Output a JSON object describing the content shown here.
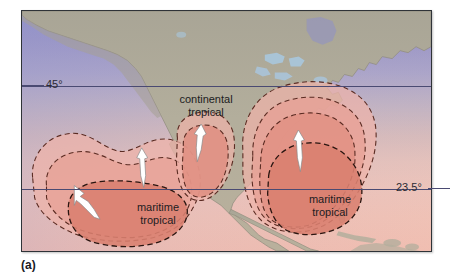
{
  "figure": {
    "caption": "(a)",
    "frame_color": "#2f3338"
  },
  "map": {
    "latitude_lines": [
      {
        "label": "45°",
        "value": 45,
        "y_px": 85,
        "label_side": "left"
      },
      {
        "label": "23.5°",
        "value": 23.5,
        "y_px": 188,
        "label_side": "right"
      }
    ],
    "ocean_color": "#8e8fc8",
    "land_color": "#b3ae9c",
    "lake_color": "#a9c6dd",
    "airmass_colors": {
      "outer": "#eeb3a9",
      "middle": "#e79f94",
      "inner": "#e08d80",
      "core": "#d97f70",
      "dash_line": "#5a2b22"
    },
    "arrow_color": "#ffffff",
    "arrow_outline": "#5a5a5a"
  },
  "airmasses": [
    {
      "id": "pacific-maritime-tropical",
      "label_line1": "maritime",
      "label_line2": "tropical",
      "label_x": 137,
      "label_y": 209,
      "arrows": 2
    },
    {
      "id": "continental-tropical",
      "label_line1": "continental",
      "label_line2": "tropical",
      "label_x": 186,
      "label_y": 100,
      "arrows": 1
    },
    {
      "id": "gulf-atlantic-maritime-tropical",
      "label_line1": "maritime",
      "label_line2": "tropical",
      "label_x": 329,
      "label_y": 201,
      "arrows": 1
    }
  ]
}
